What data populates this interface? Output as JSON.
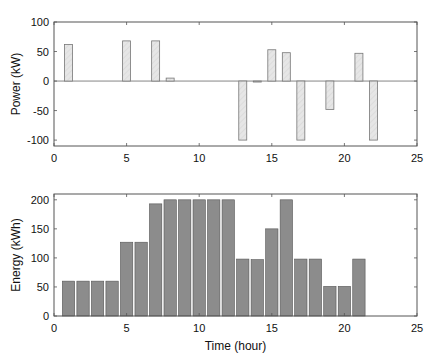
{
  "colors": {
    "power_fill": "#e6e6e6",
    "power_stroke": "#777777",
    "energy_fill": "#8c8c8c",
    "energy_stroke": "#ffffff",
    "axis": "#555555"
  },
  "chart_data": [
    {
      "type": "bar",
      "title": "",
      "xlabel": "",
      "ylabel": "Power (kW)",
      "xlim": [
        0,
        25
      ],
      "ylim": [
        -110,
        100
      ],
      "xticks": [
        0,
        5,
        10,
        15,
        20,
        25
      ],
      "yticks": [
        -100,
        -50,
        0,
        50,
        100
      ],
      "grid": false,
      "x": [
        1,
        2,
        3,
        4,
        5,
        6,
        7,
        8,
        9,
        10,
        11,
        12,
        13,
        14,
        15,
        16,
        17,
        18,
        19,
        20,
        21,
        22
      ],
      "values": [
        62,
        0,
        0,
        0,
        68,
        0,
        68,
        5,
        0,
        0,
        0,
        0,
        -100,
        -1,
        53,
        48,
        -100,
        0,
        -48,
        0,
        47,
        -100
      ]
    },
    {
      "type": "bar",
      "title": "",
      "xlabel": "Time (hour)",
      "ylabel": "Energy (kWh)",
      "xlim": [
        0,
        25
      ],
      "ylim": [
        0,
        210
      ],
      "xticks": [
        0,
        5,
        10,
        15,
        20,
        25
      ],
      "yticks": [
        0,
        50,
        100,
        150,
        200
      ],
      "grid": false,
      "x": [
        1,
        2,
        3,
        4,
        5,
        6,
        7,
        8,
        9,
        10,
        11,
        12,
        13,
        14,
        15,
        16,
        17,
        18,
        19,
        20,
        21
      ],
      "values": [
        60,
        60,
        60,
        60,
        127,
        127,
        193,
        200,
        200,
        200,
        200,
        200,
        98,
        97,
        150,
        200,
        98,
        98,
        51,
        51,
        98
      ]
    }
  ]
}
